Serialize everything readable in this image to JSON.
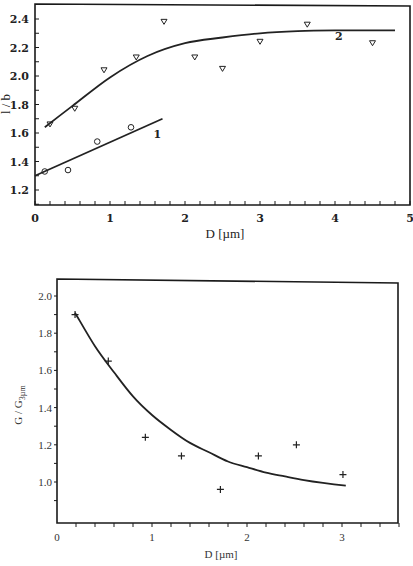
{
  "chart_data": [
    {
      "type": "scatter",
      "title": "",
      "xlabel": "D [µm]",
      "ylabel": "l / b",
      "xlim": [
        0,
        5
      ],
      "ylim": [
        1.1,
        2.5
      ],
      "x_ticks": [
        "0",
        "1",
        "2",
        "3",
        "4",
        "5"
      ],
      "x_tick_values": [
        0,
        1,
        2,
        3,
        4,
        5
      ],
      "y_ticks": [
        "1.2",
        "1.4",
        "1.6",
        "1.8",
        "2.0",
        "2.2",
        "2.4"
      ],
      "y_tick_values": [
        1.2,
        1.4,
        1.6,
        1.8,
        2.0,
        2.2,
        2.4
      ],
      "grid": false,
      "series": [
        {
          "name": "1",
          "marker": "circle",
          "points": [
            [
              0.13,
              1.33
            ],
            [
              0.44,
              1.34
            ],
            [
              0.83,
              1.54
            ],
            [
              1.28,
              1.64
            ]
          ],
          "fit_line": [
            [
              0.0,
              1.3
            ],
            [
              1.7,
              1.7
            ]
          ]
        },
        {
          "name": "2",
          "marker": "triangle-down",
          "points": [
            [
              0.2,
              1.66
            ],
            [
              0.53,
              1.77
            ],
            [
              0.92,
              2.04
            ],
            [
              1.35,
              2.13
            ],
            [
              1.72,
              2.38
            ],
            [
              2.13,
              2.13
            ],
            [
              2.5,
              2.05
            ],
            [
              3.0,
              2.24
            ],
            [
              3.63,
              2.36
            ],
            [
              4.5,
              2.23
            ]
          ],
          "fit_curve": [
            [
              0.13,
              1.64
            ],
            [
              0.5,
              1.79
            ],
            [
              1.0,
              1.99
            ],
            [
              1.5,
              2.14
            ],
            [
              2.0,
              2.23
            ],
            [
              2.5,
              2.27
            ],
            [
              3.0,
              2.3
            ],
            [
              3.5,
              2.315
            ],
            [
              4.0,
              2.32
            ],
            [
              4.8,
              2.32
            ]
          ]
        }
      ],
      "annotations": [
        {
          "text": "1",
          "x": 1.58,
          "y": 1.59
        },
        {
          "text": "2",
          "x": 4.0,
          "y": 2.28
        }
      ]
    },
    {
      "type": "scatter",
      "title": "",
      "xlabel": "D [µm]",
      "ylabel": "G / G",
      "ylabel_subscript": "3µm",
      "xlim": [
        0,
        3.6
      ],
      "ylim": [
        0.78,
        2.09
      ],
      "x_ticks": [
        "0",
        "1",
        "2",
        "3"
      ],
      "x_tick_values": [
        0,
        1,
        2,
        3
      ],
      "y_ticks": [
        "1.0",
        "1.2",
        "1.4",
        "1.6",
        "1.8",
        "2.0"
      ],
      "y_tick_values": [
        1.0,
        1.2,
        1.4,
        1.6,
        1.8,
        2.0
      ],
      "grid": false,
      "series": [
        {
          "name": "G/G3µm",
          "marker": "plus",
          "points": [
            [
              0.19,
              1.9
            ],
            [
              0.54,
              1.65
            ],
            [
              0.93,
              1.24
            ],
            [
              1.31,
              1.14
            ],
            [
              1.72,
              0.96
            ],
            [
              2.12,
              1.14
            ],
            [
              2.52,
              1.2
            ],
            [
              3.01,
              1.04
            ]
          ],
          "fit_curve": [
            [
              0.19,
              1.91
            ],
            [
              0.4,
              1.73
            ],
            [
              0.6,
              1.59
            ],
            [
              0.8,
              1.46
            ],
            [
              1.0,
              1.36
            ],
            [
              1.2,
              1.28
            ],
            [
              1.4,
              1.21
            ],
            [
              1.6,
              1.16
            ],
            [
              1.8,
              1.11
            ],
            [
              2.0,
              1.08
            ],
            [
              2.2,
              1.05
            ],
            [
              2.4,
              1.03
            ],
            [
              2.6,
              1.01
            ],
            [
              2.8,
              0.995
            ],
            [
              3.04,
              0.98
            ]
          ]
        }
      ]
    }
  ]
}
